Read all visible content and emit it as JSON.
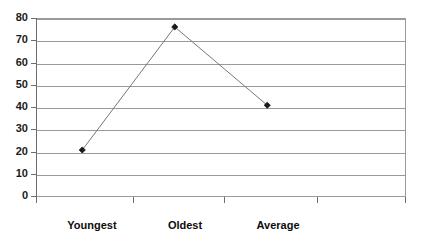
{
  "chart_data": {
    "type": "line",
    "title": "",
    "subtitle": "",
    "xlabel": "",
    "ylabel": "",
    "categories": [
      "Youngest",
      "Oldest",
      "Average"
    ],
    "values": [
      21,
      76,
      41
    ],
    "series": [
      {
        "name": "Series1",
        "values": [
          21,
          76,
          41
        ]
      }
    ],
    "ylim": [
      0,
      80
    ],
    "yticks": [
      0,
      10,
      20,
      30,
      40,
      50,
      60,
      70,
      80
    ],
    "ytick_labels": [
      "0",
      "10",
      "20",
      "30",
      "40",
      "50",
      "60",
      "70",
      "80"
    ],
    "grid": true,
    "grid_axis": "y",
    "legend": false,
    "legend_position": "none",
    "marker": "diamond",
    "marker_color": "#1a1a1a",
    "line_color": "#777777",
    "plot_background": "#ffffff",
    "frame_color": "#9a9a9a",
    "n_x_slots": 4,
    "annotations": []
  }
}
